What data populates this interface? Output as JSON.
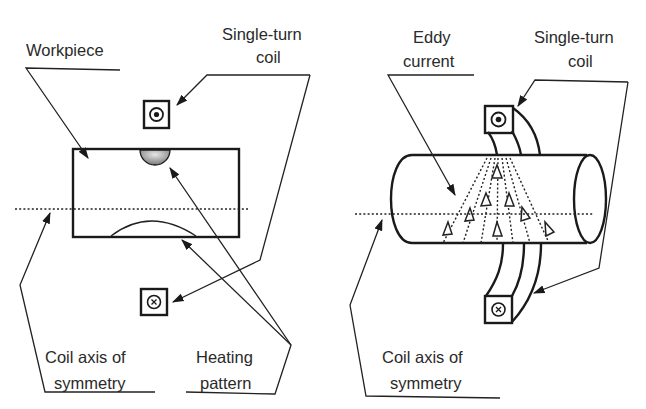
{
  "left_diagram": {
    "title": "Flat workpiece with single-turn coil (cross-section)",
    "labels": {
      "workpiece": "Workpiece",
      "coil_line1": "Single-turn",
      "coil_line2": "coil",
      "axis_line1": "Coil axis of",
      "axis_line2": "symmetry",
      "heating_line1": "Heating",
      "heating_line2": "pattern"
    },
    "symbols": {
      "coil_top": "current-out-of-page (dot)",
      "coil_bottom": "current-into-page (cross)"
    }
  },
  "right_diagram": {
    "title": "Cylindrical workpiece with single-turn coil (3D view)",
    "labels": {
      "eddy_line1": "Eddy",
      "eddy_line2": "current",
      "coil_line1": "Single-turn",
      "coil_line2": "coil",
      "axis_line1": "Coil axis of",
      "axis_line2": "symmetry"
    },
    "symbols": {
      "coil_top": "current-out-of-page (dot)",
      "coil_bottom": "current-into-page (cross)"
    }
  },
  "colors": {
    "ink": "#1a1a1a",
    "text": "#2a2a2a",
    "background": "#ffffff",
    "heating_fill": "#9a9a9a"
  }
}
